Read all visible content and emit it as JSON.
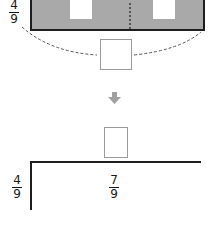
{
  "diagram": {
    "top_fraction": {
      "numerator": "4",
      "denominator": "9"
    },
    "model": {
      "description": "Grey rectangle split by a dashed line into two halves, each with a white cut-out",
      "fill_color": "#a9a9a9",
      "border_color": "#1e1e1e",
      "parts": 2
    },
    "answer_box_top": {
      "value": ""
    },
    "arrow": {
      "icon": "down-arrow-icon",
      "color": "#a0a0a0"
    },
    "answer_box_quotient": {
      "value": ""
    },
    "division": {
      "divisor": {
        "numerator": "4",
        "denominator": "9"
      },
      "dividend": {
        "numerator": "7",
        "denominator": "9"
      }
    }
  }
}
